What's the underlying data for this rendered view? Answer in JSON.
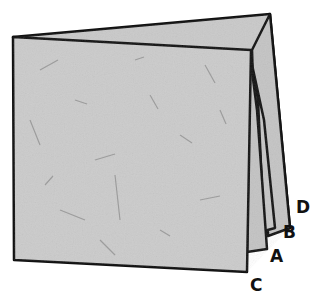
{
  "diagram": {
    "labels": [
      {
        "id": "D",
        "text": "D",
        "x": 296,
        "y": 213
      },
      {
        "id": "B",
        "text": "B",
        "x": 285,
        "y": 237
      },
      {
        "id": "A",
        "text": "A",
        "x": 272,
        "y": 262
      },
      {
        "id": "C",
        "text": "C",
        "x": 257,
        "y": 291
      }
    ],
    "colors": {
      "paper": "#c9c9c9",
      "paper_dark": "#b9b9b9",
      "outline": "#111111",
      "fiber": "#8a8a8a"
    }
  }
}
